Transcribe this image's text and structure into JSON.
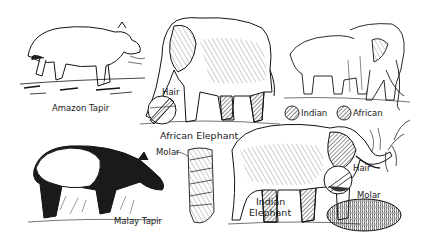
{
  "figure": {
    "type": "line-art illustration",
    "colors": {
      "ink": "#141414",
      "paper": "#ffffff",
      "shade": "#3a3a3a"
    }
  },
  "labels": {
    "amazon_tapir": "Amazon Tapir",
    "african_elephant": "African Elephant",
    "african_hair": "Hair",
    "indian_swatch": "Indian",
    "african_swatch": "African",
    "malay_tapir": "Malay Tapir",
    "african_molar": "Molar",
    "indian_elephant_line1": "Indian",
    "indian_elephant_line2": "Elephant",
    "indian_hair": "Hair",
    "indian_molar": "Molar"
  },
  "illustrations": [
    {
      "name": "amazon-tapir",
      "region": [
        20,
        30,
        145,
        100
      ]
    },
    {
      "name": "african-elephant",
      "region": [
        140,
        12,
        275,
        128
      ]
    },
    {
      "name": "elephant-pair",
      "region": [
        285,
        20,
        410,
        100
      ]
    },
    {
      "name": "malay-tapir",
      "region": [
        25,
        145,
        165,
        225
      ]
    },
    {
      "name": "african-molar",
      "region": [
        185,
        145,
        215,
        225
      ]
    },
    {
      "name": "indian-elephant",
      "region": [
        222,
        120,
        400,
        225
      ]
    },
    {
      "name": "indian-molar",
      "region": [
        328,
        198,
        400,
        232
      ]
    }
  ]
}
